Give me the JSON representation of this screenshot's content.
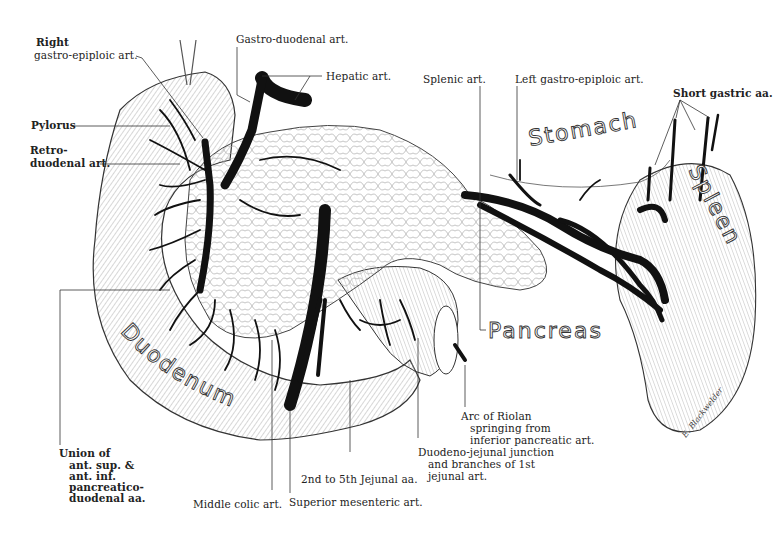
{
  "figure": {
    "organs": {
      "stomach": "Stomach",
      "spleen": "Spleen",
      "pancreas": "Pancreas",
      "duodenum": "Duodenum"
    },
    "labels": {
      "right_gastro_epiploic_1": "Right",
      "right_gastro_epiploic_2": "gastro-epiploic art.",
      "pylorus": "Pylorus",
      "retro_duodenal_1": "Retro-",
      "retro_duodenal_2": "duodenal art.",
      "gastro_duodenal": "Gastro-duodenal art.",
      "hepatic": "Hepatic art.",
      "splenic": "Splenic art.",
      "left_gastro_epiploic": "Left gastro-epiploic art.",
      "short_gastric": "Short gastric aa.",
      "union_1": "Union of",
      "union_2": "ant. sup. &",
      "union_3": "ant. inf.",
      "union_4": "pancreatico-",
      "union_5": "duodenal aa.",
      "middle_colic": "Middle colic art.",
      "superior_mesenteric": "Superior mesenteric art.",
      "jejunal": "2nd to 5th Jejunal aa.",
      "duodeno_jejunal_1": "Duodeno-jejunal junction",
      "duodeno_jejunal_2": "and branches of 1st",
      "duodeno_jejunal_3": "jejunal art.",
      "riolan_1": "Arc of Riolan",
      "riolan_2": "springing from",
      "riolan_3": "inferior pancreatic art."
    },
    "signature": "E. Blackwelder",
    "colors": {
      "vessel": "#111111",
      "outline": "#333333",
      "hatch": "#8a8a8a",
      "background": "#ffffff"
    }
  }
}
